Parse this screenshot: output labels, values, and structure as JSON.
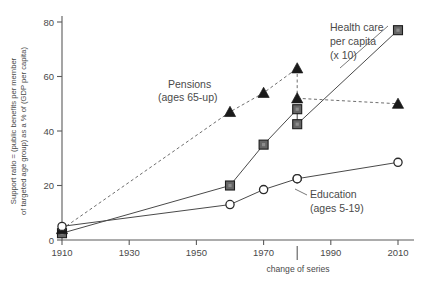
{
  "chart_data": {
    "type": "line",
    "title": "",
    "subtitle": "",
    "xlabel": "change of series",
    "ylabel": "Support ratio = (public benefits per member of targeted age group) as a % of (GDP per capita)",
    "xlim": [
      1910,
      2010
    ],
    "ylim": [
      0,
      80
    ],
    "grid": false,
    "legend_position": "inline-annotations",
    "xticks": [
      1910,
      1930,
      1950,
      1970,
      1990,
      2010
    ],
    "xtick_labels": [
      "1910",
      "1930",
      "1950",
      "1970",
      "1990",
      "2010"
    ],
    "yticks": [
      0,
      20,
      40,
      60,
      80
    ],
    "ytick_labels": [
      "0",
      "20",
      "40",
      "60",
      "80"
    ],
    "annotations": [
      {
        "name": "change-of-series-marker",
        "text": "change of series",
        "x": 1980
      }
    ],
    "series": [
      {
        "name": "Pensions (ages 65-up)",
        "label_line1": "Pensions",
        "label_line2": "(ages 65-up)",
        "marker": "triangle",
        "linestyle": "dashed",
        "color": "#1a1a1a",
        "points_before_break": [
          {
            "x": 1910,
            "y": 4
          },
          {
            "x": 1960,
            "y": 47
          },
          {
            "x": 1970,
            "y": 54
          },
          {
            "x": 1980,
            "y": 63
          }
        ],
        "points_after_break": [
          {
            "x": 1980,
            "y": 52
          },
          {
            "x": 2010,
            "y": 50
          }
        ]
      },
      {
        "name": "Health care per capita (x 10)",
        "label_line1": "Health care",
        "label_line2": "per capita",
        "label_line3": "(x 10)",
        "marker": "square",
        "linestyle": "solid",
        "color": "#666666",
        "points_before_break": [
          {
            "x": 1910,
            "y": 2.5
          },
          {
            "x": 1960,
            "y": 20
          },
          {
            "x": 1970,
            "y": 35
          },
          {
            "x": 1980,
            "y": 48
          }
        ],
        "points_after_break": [
          {
            "x": 1980,
            "y": 42.5
          },
          {
            "x": 2010,
            "y": 77
          }
        ]
      },
      {
        "name": "Education (ages 5-19)",
        "label_line1": "Education",
        "label_line2": "(ages 5-19)",
        "marker": "circle",
        "linestyle": "solid",
        "color": "#2a2a2a",
        "points_before_break": [
          {
            "x": 1910,
            "y": 5
          },
          {
            "x": 1960,
            "y": 13
          },
          {
            "x": 1970,
            "y": 18.5
          },
          {
            "x": 1980,
            "y": 22.5
          }
        ],
        "points_after_break": [
          {
            "x": 1980,
            "y": 22.5
          },
          {
            "x": 2010,
            "y": 28.5
          }
        ]
      }
    ]
  }
}
